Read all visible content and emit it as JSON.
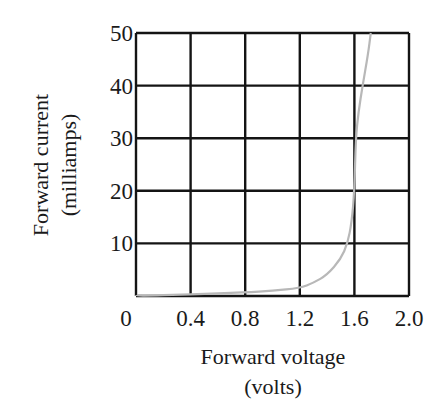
{
  "chart_data": {
    "type": "line",
    "title": "",
    "xlabel": "Forward voltage",
    "xlabel_unit": "(volts)",
    "ylabel": "Forward current",
    "ylabel_unit": "(milliamps)",
    "xlim": [
      0,
      2.0
    ],
    "ylim": [
      0,
      50
    ],
    "x_ticks": [
      "0",
      "0.4",
      "0.8",
      "1.2",
      "1.6",
      "2.0"
    ],
    "x_tick_values": [
      0,
      0.4,
      0.8,
      1.2,
      1.6,
      2.0
    ],
    "y_ticks": [
      "10",
      "20",
      "30",
      "40",
      "50"
    ],
    "y_tick_values": [
      10,
      20,
      30,
      40,
      50
    ],
    "grid": true,
    "legend": null,
    "series": [
      {
        "name": "Diode I-V curve",
        "color": "#b8b8b8",
        "x": [
          0,
          0.4,
          0.8,
          1.0,
          1.2,
          1.3,
          1.4,
          1.5,
          1.55,
          1.58,
          1.6,
          1.61,
          1.63,
          1.66,
          1.7,
          1.72
        ],
        "y": [
          0,
          0.3,
          0.7,
          1.0,
          1.5,
          2.5,
          4.0,
          7.0,
          10.0,
          14.0,
          20.0,
          30.0,
          35.0,
          40.0,
          46.0,
          50.0
        ]
      }
    ]
  },
  "colors": {
    "grid": "#141414",
    "curve": "#b8b8b8",
    "text": "#1a1a1a",
    "background": "#ffffff"
  }
}
